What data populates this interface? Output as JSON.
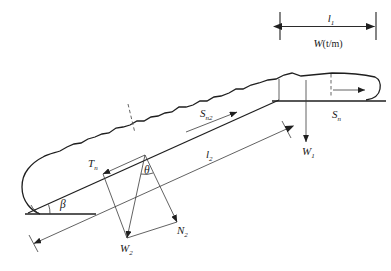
{
  "figure": {
    "background_color": "#ffffff",
    "line_color": "#1f1f1f",
    "width": 391,
    "height": 271
  },
  "labels": {
    "l1": {
      "symbol": "l",
      "sub": "1",
      "text": "l₁"
    },
    "l2": {
      "symbol": "l",
      "sub": "2",
      "text": "l₂"
    },
    "w_unit": {
      "text": "W(t/m)",
      "base": "W",
      "unit": "(t/m)"
    },
    "w1": {
      "symbol": "W",
      "sub": "1",
      "text": "W₁"
    },
    "w2": {
      "symbol": "W",
      "sub": "2",
      "text": "W₂"
    },
    "n2": {
      "symbol": "N",
      "sub": "2",
      "text": "N₂"
    },
    "tn": {
      "symbol": "T",
      "sub": "n",
      "text": "Tₙ"
    },
    "sn": {
      "symbol": "S",
      "sub": "n",
      "text": "Sₙ"
    },
    "sn2": {
      "symbol": "S",
      "sub": "n2",
      "text": "Sₙ₂"
    },
    "beta": {
      "symbol": "β",
      "text": "β"
    },
    "theta": {
      "symbol": "θ",
      "text": "θ"
    }
  },
  "annotations": {
    "dimension_lines": [
      {
        "name": "l1-dimension",
        "label": "l₁",
        "orientation": "horizontal",
        "position": "top-right"
      },
      {
        "name": "l2-dimension",
        "label": "l₂",
        "orientation": "inclined",
        "position": "slope-parallel"
      }
    ],
    "force_vectors": [
      {
        "name": "w1-vector",
        "label": "W₁",
        "direction": "down"
      },
      {
        "name": "w2-vector",
        "label": "W₂",
        "direction": "down-left"
      },
      {
        "name": "n2-vector",
        "label": "N₂",
        "direction": "down-right"
      },
      {
        "name": "tn-vector",
        "label": "Tₙ",
        "direction": "up-left"
      },
      {
        "name": "sn-vector",
        "label": "Sₙ",
        "direction": "right"
      },
      {
        "name": "sn2-vector",
        "label": "Sₙ₂",
        "direction": "up-right"
      }
    ],
    "angles": [
      {
        "name": "beta-angle",
        "label": "β",
        "description": "slope inclination at toe"
      },
      {
        "name": "theta-angle",
        "label": "θ",
        "description": "angle between W2 and N2"
      }
    ]
  }
}
